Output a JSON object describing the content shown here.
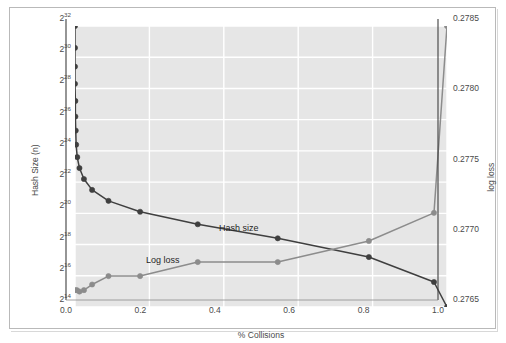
{
  "figure": {
    "background": "#ffffff",
    "frame_color": "#b9b9b9",
    "plot_background": "#e6e6e6",
    "gridline_color": "#ffffff"
  },
  "axes": {
    "x": {
      "title": "% Collisions",
      "ticks": [
        "0.0",
        "0.2",
        "0.4",
        "0.6",
        "0.8",
        "1.0"
      ],
      "tick_values": [
        0.0,
        0.2,
        0.4,
        0.6,
        0.8,
        1.0
      ],
      "min": 0.0,
      "max": 1.0
    },
    "y_left": {
      "title": "Hash Size (n)",
      "ticks": [
        "2^32",
        "2^30",
        "2^28",
        "2^26",
        "2^24",
        "2^22",
        "2^20",
        "2^18",
        "2^16",
        "2^14"
      ],
      "tick_exponents": [
        32,
        30,
        28,
        26,
        24,
        22,
        20,
        18,
        16,
        14
      ],
      "min_exponent": 14,
      "max_exponent": 32
    },
    "y_right": {
      "title": "log loss",
      "ticks": [
        "0.2785",
        "0.2780",
        "0.2775",
        "0.2770",
        "0.2765"
      ],
      "tick_values": [
        0.2785,
        0.278,
        0.2775,
        0.277,
        0.2765
      ],
      "min": 0.2765,
      "max": 0.2785
    }
  },
  "annotations": {
    "hash_size_label": "Hash size",
    "log_loss_label": "Log loss"
  },
  "chart_data": {
    "type": "line",
    "title": "",
    "subtitle": "",
    "xlabel": "% Collisions",
    "ylabel": "Hash Size (n)",
    "ylabel_secondary": "log loss",
    "xlim": [
      0.0,
      1.0
    ],
    "ylim": [
      14,
      32
    ],
    "ylim_secondary": [
      0.2765,
      0.2785
    ],
    "grid": true,
    "legend": "inline-annotations",
    "legend_position": "inline",
    "color_hash_size": "#3f3f3f",
    "color_log_loss": "#8c8c8c",
    "marker": "circle",
    "series": [
      {
        "name": "Hash size",
        "axis": "left",
        "color": "#3f3f3f",
        "y_unit": "log2(n)",
        "points": [
          {
            "x": 0.0,
            "y": 32.0
          },
          {
            "x": 0.0,
            "y": 30.6
          },
          {
            "x": 0.0,
            "y": 29.4
          },
          {
            "x": 0.0,
            "y": 28.3
          },
          {
            "x": 0.001,
            "y": 27.2
          },
          {
            "x": 0.001,
            "y": 26.2
          },
          {
            "x": 0.002,
            "y": 25.3
          },
          {
            "x": 0.003,
            "y": 24.4
          },
          {
            "x": 0.006,
            "y": 23.6
          },
          {
            "x": 0.012,
            "y": 22.9
          },
          {
            "x": 0.024,
            "y": 22.2
          },
          {
            "x": 0.046,
            "y": 21.5
          },
          {
            "x": 0.09,
            "y": 20.8
          },
          {
            "x": 0.175,
            "y": 20.1
          },
          {
            "x": 0.33,
            "y": 19.3
          },
          {
            "x": 0.545,
            "y": 18.4
          },
          {
            "x": 0.79,
            "y": 17.2
          },
          {
            "x": 0.965,
            "y": 15.6
          },
          {
            "x": 1.0,
            "y": 14.0
          }
        ]
      },
      {
        "name": "Log loss",
        "axis": "right",
        "color": "#8c8c8c",
        "points": [
          {
            "x": 0.0,
            "y": 0.27662
          },
          {
            "x": 0.005,
            "y": 0.27662
          },
          {
            "x": 0.012,
            "y": 0.27661
          },
          {
            "x": 0.024,
            "y": 0.27662
          },
          {
            "x": 0.046,
            "y": 0.27666
          },
          {
            "x": 0.09,
            "y": 0.27672
          },
          {
            "x": 0.175,
            "y": 0.27672
          },
          {
            "x": 0.33,
            "y": 0.27682
          },
          {
            "x": 0.545,
            "y": 0.27682
          },
          {
            "x": 0.79,
            "y": 0.27697
          },
          {
            "x": 0.965,
            "y": 0.27717
          },
          {
            "x": 1.0,
            "y": 0.2785
          }
        ]
      }
    ]
  }
}
